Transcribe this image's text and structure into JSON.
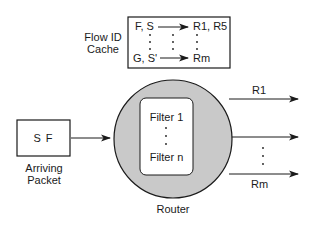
{
  "diagram": {
    "cache": {
      "label_line1": "Flow ID",
      "label_line2": "Cache",
      "rows": [
        {
          "key": "F, S",
          "value": "R1, R5"
        },
        {
          "key": "G, S'",
          "value": "Rm"
        }
      ]
    },
    "packet": {
      "content": "S F",
      "label_line1": "Arriving",
      "label_line2": "Packet"
    },
    "router": {
      "label": "Router",
      "filters": {
        "first": "Filter 1",
        "last": "Filter n"
      }
    },
    "outputs": {
      "first": "R1",
      "last": "Rm"
    },
    "colors": {
      "router_fill": "#c9c9c9",
      "stroke": "#1a1a1a",
      "filter_fill": "#ffffff"
    }
  }
}
